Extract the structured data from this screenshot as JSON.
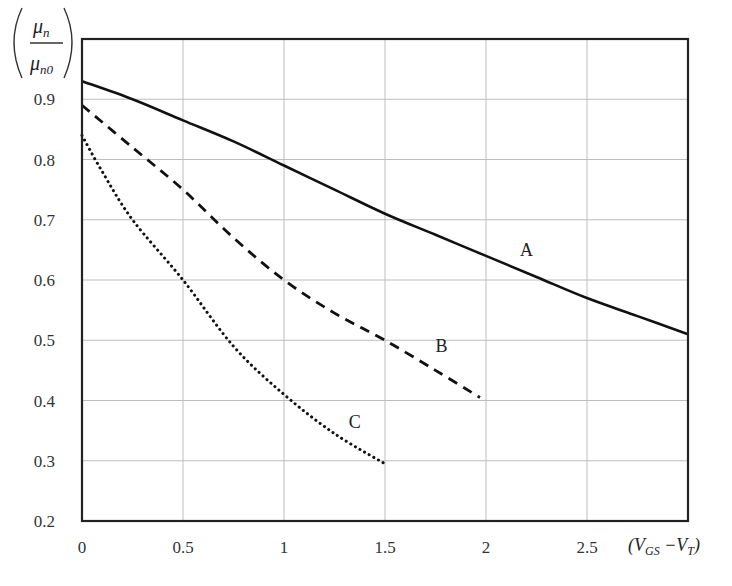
{
  "chart_data": {
    "type": "line",
    "title": "",
    "xlabel": "(V_GS − V_T)",
    "ylabel": "μn / μn0",
    "xlim": [
      0,
      3
    ],
    "ylim": [
      0.2,
      1.0
    ],
    "x_ticks": [
      "0",
      "0.5",
      "1",
      "1.5",
      "2",
      "2.5"
    ],
    "y_ticks": [
      "0.2",
      "0.3",
      "0.4",
      "0.5",
      "0.6",
      "0.7",
      "0.8",
      "0.9"
    ],
    "grid": true,
    "legend": "inline labels",
    "series": [
      {
        "name": "A",
        "style": "solid",
        "x": [
          0,
          0.25,
          0.5,
          0.75,
          1.0,
          1.25,
          1.5,
          1.75,
          2.0,
          2.25,
          2.5,
          2.75,
          3.0
        ],
        "y": [
          0.93,
          0.9,
          0.865,
          0.83,
          0.79,
          0.75,
          0.71,
          0.675,
          0.64,
          0.605,
          0.57,
          0.54,
          0.51
        ],
        "label_pos": [
          2.2,
          0.64
        ]
      },
      {
        "name": "B",
        "style": "dashed",
        "x": [
          0,
          0.25,
          0.5,
          0.75,
          1.0,
          1.25,
          1.5,
          1.75,
          1.97
        ],
        "y": [
          0.89,
          0.82,
          0.75,
          0.67,
          0.6,
          0.545,
          0.5,
          0.45,
          0.405
        ],
        "label_pos": [
          1.78,
          0.48
        ]
      },
      {
        "name": "C",
        "style": "dotted",
        "x": [
          0,
          0.1,
          0.25,
          0.5,
          0.75,
          1.0,
          1.25,
          1.5
        ],
        "y": [
          0.84,
          0.78,
          0.7,
          0.6,
          0.49,
          0.41,
          0.345,
          0.295
        ],
        "label_pos": [
          1.35,
          0.355
        ]
      }
    ]
  },
  "labels": {
    "y_num": "μ",
    "y_num_sub": "n",
    "y_den": "μ",
    "y_den_sub": "n0",
    "x_axis_open": "(V",
    "x_axis_sub1": "GS",
    "x_axis_mid": " −V",
    "x_axis_sub2": "T",
    "x_axis_close": ")"
  }
}
